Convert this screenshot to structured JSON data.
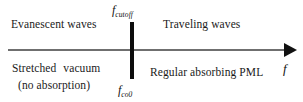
{
  "figure": {
    "type": "number-line-regime-diagram",
    "background_color": "#ffffff",
    "axis": {
      "variable_label": "f",
      "variable_label_name": "frequency",
      "direction": "rightward",
      "line_color": "#6f6f6f",
      "arrow_color": "#111111"
    },
    "divider": {
      "color": "#0d0d0d",
      "top_label_base": "f",
      "top_label_subscript": "cutoff",
      "bottom_label_base": "f",
      "bottom_label_subscript": "co0"
    },
    "regions": {
      "upper_left": "Evanescent waves",
      "upper_right": "Traveling waves",
      "lower_left_line1_word1": "Stretched",
      "lower_left_line1_word2": "vacuum",
      "lower_left_line2": "(no absorption)",
      "lower_right": "Regular absorbing PML"
    }
  }
}
